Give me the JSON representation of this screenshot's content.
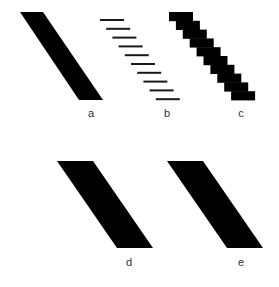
{
  "figure": {
    "background": "#ffffff",
    "fill_color": "#000000",
    "line_color": "#1a1a1a",
    "label_color": "#333333",
    "panels": [
      {
        "id": "a",
        "label": "a",
        "kind": "solid-parallelogram",
        "polygon": [
          [
            20,
            12
          ],
          [
            43,
            12
          ],
          [
            103,
            100
          ],
          [
            79,
            100
          ]
        ],
        "label_pos": [
          91,
          113
        ]
      },
      {
        "id": "b",
        "label": "b",
        "kind": "horizontal-scanlines",
        "line_count": 10,
        "first_line": {
          "x1": 100,
          "x2": 124,
          "y": 20
        },
        "x_step": 6.2,
        "y_step": 8.8,
        "thickness": 2,
        "label_pos": [
          167,
          113
        ]
      },
      {
        "id": "c",
        "label": "c",
        "kind": "staircase",
        "step_count": 10,
        "first_step": {
          "x": 169,
          "y": 12,
          "width": 24,
          "height": 8.8
        },
        "x_step": 6.9,
        "label_pos": [
          241,
          113
        ]
      },
      {
        "id": "d",
        "label": "d",
        "kind": "antialiased-parallelogram",
        "polygon": [
          [
            57,
            161
          ],
          [
            93,
            161
          ],
          [
            153,
            248
          ],
          [
            117,
            248
          ]
        ],
        "label_pos": [
          129,
          262
        ]
      },
      {
        "id": "e",
        "label": "e",
        "kind": "antialiased-parallelogram",
        "polygon": [
          [
            167,
            161
          ],
          [
            203,
            161
          ],
          [
            263,
            248
          ],
          [
            227,
            248
          ]
        ],
        "label_pos": [
          241,
          262
        ]
      }
    ]
  }
}
